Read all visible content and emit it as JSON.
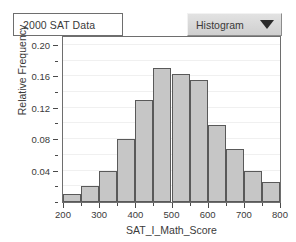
{
  "title_box": {
    "label": "2000 SAT Data"
  },
  "chart_type_selector": {
    "selected": "Histogram",
    "icon": "chevron-down-icon",
    "options": [
      "Histogram"
    ]
  },
  "colors": {
    "bar_fill": "#c6c6c6",
    "bar_border": "#595959",
    "frame": "#6e6e6e",
    "gridline": "#f0f0f0",
    "text": "#3a3a3a"
  },
  "chart_data": {
    "type": "bar",
    "title": "2000 SAT Data",
    "xlabel": "SAT_I_Math_Score",
    "ylabel": "Relative Frequency",
    "xlim": [
      200,
      800
    ],
    "ylim": [
      0,
      0.21
    ],
    "bin_width": 50,
    "grid": true,
    "legend": "none",
    "x_ticks": [
      200,
      300,
      400,
      500,
      600,
      700,
      800
    ],
    "x_minor_ticks": [
      250,
      350,
      450,
      550,
      650,
      750
    ],
    "y_ticks": [
      0.04,
      0.08,
      0.12,
      0.16,
      0.2
    ],
    "y_minor_ticks": [
      0.02,
      0.06,
      0.1,
      0.14,
      0.18
    ],
    "bins": [
      {
        "start": 200,
        "end": 250,
        "value": 0.01
      },
      {
        "start": 250,
        "end": 300,
        "value": 0.02
      },
      {
        "start": 300,
        "end": 350,
        "value": 0.04
      },
      {
        "start": 350,
        "end": 400,
        "value": 0.08
      },
      {
        "start": 400,
        "end": 450,
        "value": 0.13
      },
      {
        "start": 450,
        "end": 500,
        "value": 0.17
      },
      {
        "start": 500,
        "end": 550,
        "value": 0.163
      },
      {
        "start": 550,
        "end": 600,
        "value": 0.155
      },
      {
        "start": 600,
        "end": 650,
        "value": 0.098
      },
      {
        "start": 650,
        "end": 700,
        "value": 0.067
      },
      {
        "start": 700,
        "end": 750,
        "value": 0.04
      },
      {
        "start": 750,
        "end": 800,
        "value": 0.025
      }
    ]
  }
}
